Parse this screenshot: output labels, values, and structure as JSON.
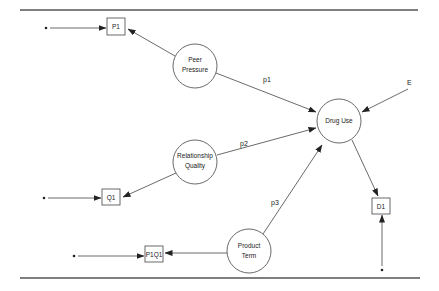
{
  "diagram": {
    "type": "path-model",
    "latent_variables": [
      {
        "id": "peer_pressure",
        "lines": [
          "Peer",
          "Pressure"
        ],
        "cx": 195,
        "cy": 66,
        "r": 22
      },
      {
        "id": "relationship_quality",
        "lines": [
          "Relationship",
          "Quality"
        ],
        "cx": 195,
        "cy": 162,
        "r": 22
      },
      {
        "id": "product_term",
        "lines": [
          "Product",
          "Term"
        ],
        "cx": 249,
        "cy": 251,
        "r": 22
      },
      {
        "id": "drug_use",
        "lines": [
          "Drug Use"
        ],
        "cx": 339,
        "cy": 121,
        "r": 22
      }
    ],
    "indicators": [
      {
        "id": "P1",
        "label": "P1",
        "x": 107,
        "y": 18,
        "w": 18,
        "h": 17
      },
      {
        "id": "Q1",
        "label": "Q1",
        "x": 102,
        "y": 189,
        "w": 18,
        "h": 16
      },
      {
        "id": "P1Q1",
        "label": "P1Q1",
        "x": 145,
        "y": 246,
        "w": 18,
        "h": 16
      },
      {
        "id": "D1",
        "label": "D1",
        "x": 372,
        "y": 198,
        "w": 18,
        "h": 16
      }
    ],
    "path_labels": [
      {
        "id": "p1",
        "text": "p1",
        "x": 263,
        "y": 82
      },
      {
        "id": "p2",
        "text": "p2",
        "x": 240,
        "y": 146
      },
      {
        "id": "p3",
        "text": "p3",
        "x": 271,
        "y": 205
      }
    ],
    "error_label": {
      "text": "E",
      "x": 409,
      "y": 84
    },
    "edges": [
      {
        "from": "peer_pressure",
        "to": "P1"
      },
      {
        "from": "relationship_quality",
        "to": "Q1"
      },
      {
        "from": "product_term",
        "to": "P1Q1"
      },
      {
        "from": "peer_pressure",
        "to": "drug_use",
        "label": "p1"
      },
      {
        "from": "relationship_quality",
        "to": "drug_use",
        "label": "p2"
      },
      {
        "from": "product_term",
        "to": "drug_use",
        "label": "p3"
      },
      {
        "from": "E",
        "to": "drug_use"
      },
      {
        "from": "drug_use",
        "to": "D1"
      },
      {
        "from": "error_dot",
        "to": "P1"
      },
      {
        "from": "error_dot",
        "to": "Q1"
      },
      {
        "from": "error_dot",
        "to": "P1Q1"
      },
      {
        "from": "error_dot",
        "to": "D1"
      }
    ]
  },
  "labels": {
    "peer_1": "Peer",
    "peer_2": "Pressure",
    "rel_1": "Relationship",
    "rel_2": "Quality",
    "prod_1": "Product",
    "prod_2": "Term",
    "drug": "Drug Use",
    "P1": "P1",
    "Q1": "Q1",
    "P1Q1": "P1Q1",
    "D1": "D1",
    "p1": "p1",
    "p2": "p2",
    "p3": "p3",
    "E": "E"
  }
}
